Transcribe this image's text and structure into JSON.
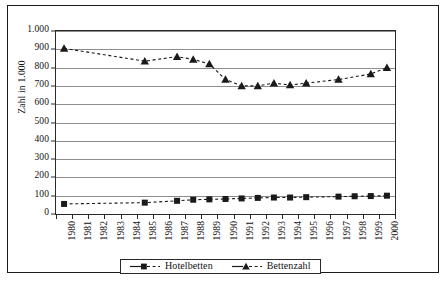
{
  "chart_data": {
    "type": "line",
    "title": "",
    "xlabel": "",
    "ylabel": "Zahl in 1.000",
    "ylim": [
      0,
      1000
    ],
    "ytick_labels": [
      "0",
      "100",
      "200",
      "300",
      "400",
      "500",
      "600",
      "700",
      "800",
      "900",
      "1.000"
    ],
    "ytick_values": [
      0,
      100,
      200,
      300,
      400,
      500,
      600,
      700,
      800,
      900,
      1000
    ],
    "grid": true,
    "legend_position": "bottom-center",
    "categories": [
      "1980",
      "1981",
      "1982",
      "1983",
      "1984",
      "1985",
      "1986",
      "1987",
      "1988",
      "1989",
      "1990",
      "1991",
      "1992",
      "1993",
      "1994",
      "1995",
      "1996",
      "1997",
      "1998",
      "1999",
      "2000"
    ],
    "series": [
      {
        "name": "Hotelbetten",
        "marker": "square",
        "linestyle": "dashed",
        "color": "#1a1a1a",
        "values": [
          55,
          null,
          null,
          null,
          null,
          62,
          null,
          72,
          78,
          80,
          82,
          85,
          88,
          90,
          90,
          92,
          null,
          95,
          97,
          98,
          100
        ]
      },
      {
        "name": "Bettenzahl",
        "marker": "triangle",
        "linestyle": "dashed",
        "color": "#1a1a1a",
        "values": [
          905,
          null,
          null,
          null,
          null,
          835,
          null,
          860,
          845,
          820,
          735,
          700,
          700,
          715,
          705,
          715,
          null,
          735,
          null,
          765,
          800
        ]
      }
    ]
  },
  "axes": {
    "y_title": "Zahl in 1.000"
  },
  "legend": {
    "entries": [
      {
        "label": "Hotelbetten",
        "marker": "square-marker-icon"
      },
      {
        "label": "Bettenzahl",
        "marker": "triangle-marker-icon"
      }
    ]
  }
}
